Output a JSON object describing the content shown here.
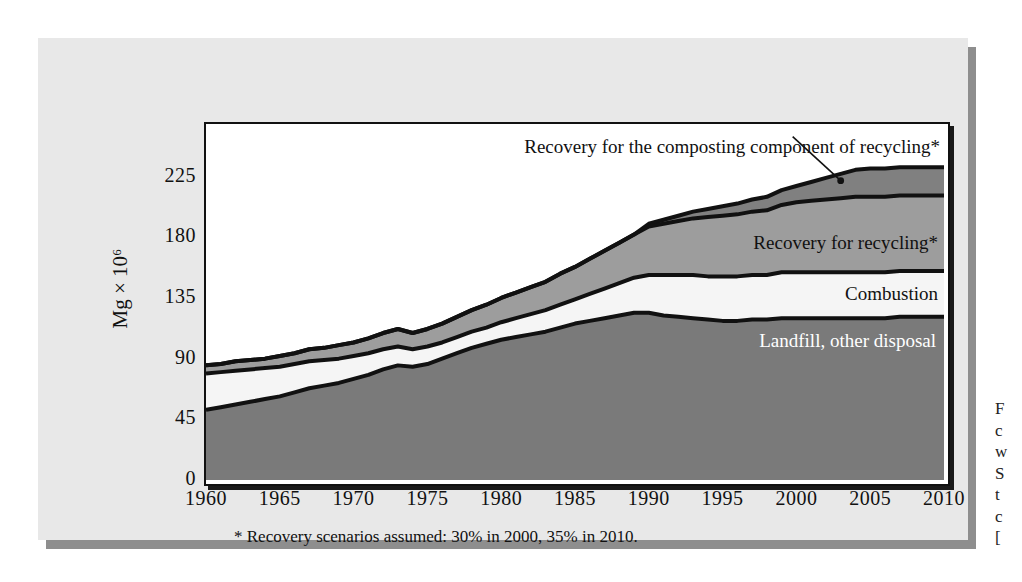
{
  "figure": {
    "y_axis_title": "Mg × 10⁶",
    "footnote": "* Recovery scenarios assumed: 30% in 2000, 35% in 2010.",
    "side_caption_lines": [
      "F",
      "c",
      "w",
      "S",
      "t",
      "c",
      "["
    ],
    "colors": {
      "panel_background": "#e8e8e8",
      "panel_shadow": "#8e8e8e",
      "plot_background": "#ffffff",
      "outline": "#111111",
      "landfill_fill": "#7a7a7a",
      "combustion_fill": "#f5f5f5",
      "recycling_fill": "#9d9d9d",
      "composting_fill": "#808080"
    }
  },
  "chart_data": {
    "type": "area",
    "title": "",
    "xlabel": "",
    "ylabel": "Mg × 10⁶",
    "xlim": [
      1960,
      2010
    ],
    "ylim": [
      0,
      264
    ],
    "grid": false,
    "legend": "inline-labels",
    "xticks": [
      1960,
      1965,
      1970,
      1975,
      1980,
      1985,
      1990,
      1995,
      2000,
      2005,
      2010
    ],
    "yticks": [
      0,
      45,
      90,
      135,
      180,
      225
    ],
    "stacked": true,
    "x": [
      1960,
      1961,
      1962,
      1963,
      1964,
      1965,
      1966,
      1967,
      1968,
      1969,
      1970,
      1971,
      1972,
      1973,
      1974,
      1975,
      1976,
      1977,
      1978,
      1979,
      1980,
      1981,
      1982,
      1983,
      1984,
      1985,
      1986,
      1987,
      1988,
      1989,
      1990,
      1991,
      1992,
      1993,
      1994,
      1995,
      1996,
      1997,
      1998,
      1999,
      2000,
      2001,
      2002,
      2003,
      2004,
      2005,
      2006,
      2007,
      2008,
      2009,
      2010
    ],
    "series": [
      {
        "name": "Landfill, other disposal",
        "label": "Landfill, other disposal",
        "fill": "#7a7a7a",
        "label_color": "#ffffff",
        "values": [
          52,
          54,
          56,
          58,
          60,
          62,
          65,
          68,
          70,
          72,
          75,
          78,
          82,
          85,
          84,
          86,
          90,
          94,
          98,
          101,
          104,
          106,
          108,
          110,
          113,
          116,
          118,
          120,
          122,
          124,
          124,
          122,
          121,
          120,
          119,
          118,
          118,
          119,
          119,
          120,
          120,
          120,
          120,
          120,
          120,
          120,
          120,
          121,
          121,
          121,
          121
        ]
      },
      {
        "name": "Combustion",
        "label": "Combustion",
        "fill": "#f5f5f5",
        "label_color": "#111111",
        "values": [
          27,
          26,
          25,
          24,
          23,
          22,
          21,
          20,
          19,
          18,
          17,
          16,
          15,
          14,
          13,
          13,
          12,
          12,
          12,
          12,
          13,
          14,
          15,
          16,
          17,
          18,
          20,
          22,
          24,
          26,
          28,
          30,
          31,
          32,
          32,
          33,
          33,
          33,
          33,
          34,
          34,
          34,
          34,
          34,
          34,
          34,
          34,
          34,
          34,
          34,
          34
        ]
      },
      {
        "name": "Recovery for recycling*",
        "label": "Recovery for recycling*",
        "fill": "#9d9d9d",
        "label_color": "#111111",
        "values": [
          6,
          6,
          7,
          7,
          7,
          8,
          8,
          9,
          9,
          10,
          10,
          11,
          12,
          13,
          12,
          13,
          14,
          15,
          16,
          17,
          18,
          19,
          20,
          21,
          23,
          24,
          26,
          28,
          30,
          32,
          36,
          38,
          40,
          42,
          44,
          45,
          46,
          47,
          48,
          50,
          52,
          53,
          54,
          55,
          56,
          56,
          56,
          56,
          56,
          56,
          56
        ]
      },
      {
        "name": "Recovery for the composting component of recycling*",
        "label": "Recovery for the composting component of recycling*",
        "fill": "#808080",
        "label_color": "#111111",
        "values": [
          0,
          0,
          0,
          0,
          0,
          0,
          0,
          0,
          0,
          0,
          0,
          0,
          0,
          0,
          0,
          0,
          0,
          0,
          0,
          0,
          0,
          0,
          0,
          0,
          0,
          0,
          0,
          0,
          0,
          0,
          2,
          3,
          4,
          5,
          6,
          7,
          8,
          9,
          10,
          11,
          12,
          14,
          16,
          18,
          20,
          21,
          21,
          21,
          21,
          21,
          21
        ]
      }
    ],
    "annotations": [
      {
        "text": "Recovery for the composting component of recycling*",
        "anchor_x": 2003,
        "anchor_y": 222,
        "leader_line": true
      }
    ]
  }
}
